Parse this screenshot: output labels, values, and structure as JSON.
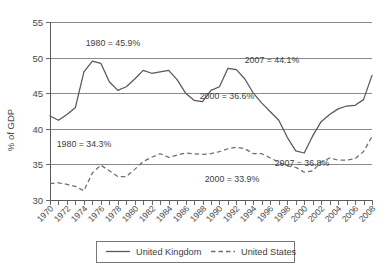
{
  "chart_data": {
    "type": "line",
    "title": "",
    "xlabel": "",
    "ylabel": "% of GDP",
    "ylim": [
      30,
      55
    ],
    "xlim": [
      1970,
      2008
    ],
    "yticks": [
      30,
      35,
      40,
      45,
      50,
      55
    ],
    "ytick_labels": [
      "30",
      "35",
      "40",
      "45",
      "50",
      "55"
    ],
    "grid": true,
    "grid_axis": "y",
    "legend_position": "bottom",
    "x": [
      1970,
      1971,
      1972,
      1973,
      1974,
      1975,
      1976,
      1977,
      1978,
      1979,
      1980,
      1981,
      1982,
      1983,
      1984,
      1985,
      1986,
      1987,
      1988,
      1989,
      1990,
      1991,
      1992,
      1993,
      1994,
      1995,
      1996,
      1997,
      1998,
      1999,
      2000,
      2001,
      2002,
      2003,
      2004,
      2005,
      2006,
      2007,
      2008
    ],
    "xtick_labels": [
      "1970",
      "1972",
      "1974",
      "1976",
      "1978",
      "1980",
      "1982",
      "1984",
      "1986",
      "1988",
      "1990",
      "1992",
      "1994",
      "1996",
      "1998",
      "2000",
      "2002",
      "2004",
      "2006",
      "2008"
    ],
    "xtick_label_step": 2,
    "minor_tick_step": 1,
    "series": [
      {
        "name": "United Kingdom",
        "style": "solid",
        "color": "#585858",
        "values": [
          41.8,
          41.2,
          42.0,
          43.0,
          48.0,
          49.5,
          49.2,
          46.6,
          45.4,
          45.9,
          47.0,
          48.2,
          47.8,
          48.0,
          48.2,
          46.9,
          45.0,
          44.0,
          43.8,
          45.4,
          45.9,
          48.5,
          48.3,
          47.0,
          45.0,
          43.6,
          42.4,
          41.2,
          38.8,
          36.9,
          36.6,
          39.0,
          41.0,
          42.0,
          42.8,
          43.2,
          43.3,
          44.1,
          47.5
        ]
      },
      {
        "name": "United States",
        "style": "dashed",
        "color": "#6d6d6d",
        "values": [
          32.3,
          32.4,
          32.2,
          31.9,
          31.3,
          33.8,
          34.9,
          34.1,
          33.3,
          33.3,
          34.3,
          35.4,
          36.0,
          36.5,
          36.0,
          36.3,
          36.6,
          36.5,
          36.4,
          36.5,
          36.8,
          37.2,
          37.4,
          37.2,
          36.5,
          36.5,
          35.9,
          35.3,
          34.8,
          34.6,
          33.9,
          34.1,
          35.3,
          35.9,
          35.6,
          35.6,
          35.8,
          36.8,
          38.9
        ]
      }
    ],
    "annotations": [
      {
        "id": "uk-1980",
        "text": "1980 = 45.9%",
        "x_px": 113,
        "y_px": 46
      },
      {
        "id": "uk-2007",
        "text": "2007 = 44.1%",
        "x_px": 272,
        "y_px": 63
      },
      {
        "id": "uk-2000",
        "text": "2000 = 36.6%",
        "x_px": 227,
        "y_px": 99
      },
      {
        "id": "us-1980",
        "text": "1980 = 34.3%",
        "x_px": 84,
        "y_px": 147
      },
      {
        "id": "us-2000",
        "text": "2000 = 33.9%",
        "x_px": 232,
        "y_px": 182
      },
      {
        "id": "us-2007",
        "text": "2007 = 36.8%",
        "x_px": 302,
        "y_px": 166
      }
    ],
    "legend": [
      {
        "label": "United Kingdom",
        "style": "solid"
      },
      {
        "label": "United States",
        "style": "dashed"
      }
    ]
  }
}
